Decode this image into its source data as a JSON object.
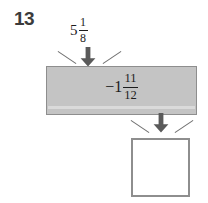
{
  "problem": {
    "number": "13"
  },
  "input": {
    "whole": "5",
    "numerator": "1",
    "denominator": "8"
  },
  "operation": {
    "whole": "−1",
    "numerator": "11",
    "denominator": "12"
  },
  "answer": {
    "value": ""
  },
  "icons": {
    "input_arrow": "arrow-down-icon",
    "output_arrow": "arrow-down-icon"
  },
  "colors": {
    "bar_fill": "#c4c4c4",
    "bar_stroke": "#8e8e8e",
    "arrow": "#5a5a5a",
    "text": "#1c1c1c",
    "number_label": "#3b3b3b",
    "box_stroke": "#8e8e8e",
    "background": "#ffffff"
  }
}
